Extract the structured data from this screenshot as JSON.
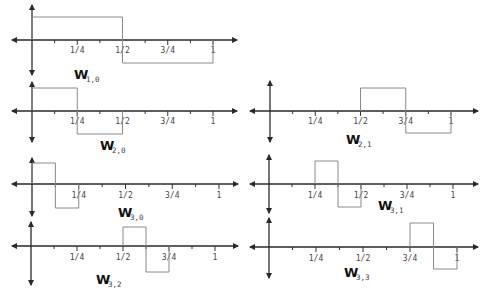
{
  "figure": {
    "tick_labels": [
      "1/4",
      "1/2",
      "3/4",
      "1"
    ],
    "colors": {
      "axis": "#2a2a2a",
      "wave": "#8a8a8a",
      "label": "#111111"
    }
  },
  "panels": [
    {
      "id": "w-1-0",
      "label": "W",
      "subscript": "1,0",
      "origin": [
        32,
        40
      ],
      "x_left": 12,
      "x_right": 237,
      "unit": 181,
      "y_top": 5,
      "y_bottom": 75,
      "high": 17,
      "low": 63,
      "support": [
        0,
        1
      ],
      "label_pos": [
        74,
        79
      ],
      "tick_label_y": 53
    },
    {
      "id": "w-2-0",
      "label": "W",
      "subscript": "2,0",
      "origin": [
        32,
        111
      ],
      "x_left": 12,
      "x_right": 237,
      "unit": 181,
      "y_top": 82,
      "y_bottom": 142,
      "high": 88,
      "low": 134,
      "support": [
        0,
        0.5
      ],
      "label_pos": [
        100,
        150
      ],
      "tick_label_y": 124
    },
    {
      "id": "w-2-1",
      "label": "W",
      "subscript": "2,1",
      "origin": [
        270,
        111
      ],
      "x_left": 250,
      "x_right": 478,
      "unit": 181,
      "y_top": 81,
      "y_bottom": 142,
      "high": 88,
      "low": 133,
      "support": [
        0.5,
        1
      ],
      "label_pos": [
        346,
        144
      ],
      "tick_label_y": 124
    },
    {
      "id": "w-3-0",
      "label": "W",
      "subscript": "3,0",
      "origin": [
        32,
        184
      ],
      "x_left": 12,
      "x_right": 238,
      "unit": 187,
      "y_top": 158,
      "y_bottom": 216,
      "high": 163,
      "low": 208,
      "support": [
        0,
        0.25
      ],
      "label_pos": [
        118,
        217
      ],
      "tick_label_y": 198
    },
    {
      "id": "w-3-1",
      "label": "W",
      "subscript": "3,1",
      "origin": [
        269,
        184
      ],
      "x_left": 250,
      "x_right": 478,
      "unit": 184,
      "y_top": 155,
      "y_bottom": 213,
      "high": 161,
      "low": 207,
      "support": [
        0.25,
        0.5
      ],
      "label_pos": [
        378,
        210
      ],
      "tick_label_y": 198
    },
    {
      "id": "w-3-2",
      "label": "W",
      "subscript": "3,2",
      "origin": [
        31,
        246
      ],
      "x_left": 12,
      "x_right": 238,
      "unit": 184,
      "y_top": 222,
      "y_bottom": 285,
      "high": 227,
      "low": 272,
      "support": [
        0.5,
        0.75
      ],
      "label_pos": [
        96,
        284
      ],
      "tick_label_y": 260
    },
    {
      "id": "w-3-3",
      "label": "W",
      "subscript": "3,3",
      "origin": [
        269,
        247
      ],
      "x_left": 250,
      "x_right": 478,
      "unit": 188,
      "y_top": 218,
      "y_bottom": 278,
      "high": 223,
      "low": 269,
      "support": [
        0.75,
        1
      ],
      "label_pos": [
        344,
        277
      ],
      "tick_label_y": 261
    }
  ]
}
